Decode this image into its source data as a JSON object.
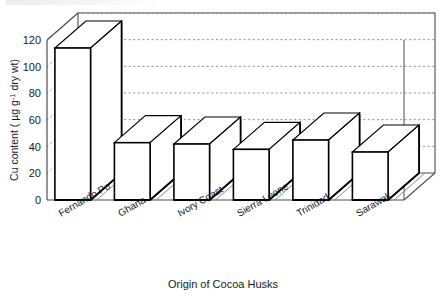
{
  "chart_data": {
    "type": "bar",
    "title": "",
    "subtitle": "",
    "xlabel": "Origin of Cocoa Husks",
    "ylabel": "Cu content ( µg g⁻¹ dry wt)",
    "ylabel_parts": {
      "pre": "Cu content ( µg g",
      "sup": "-1",
      "post": " dry wt)"
    },
    "categories": [
      "Fernando Po",
      "Ghana",
      "Ivory Coast",
      "Sierra Leone",
      "Trinidad",
      "Sarawak"
    ],
    "values": [
      114,
      43,
      42,
      38,
      45,
      36
    ],
    "ylim": [
      0,
      120
    ],
    "yticks": [
      0,
      20,
      40,
      60,
      80,
      100,
      120
    ],
    "ytick_labels": [
      "0",
      "20",
      "40",
      "60",
      "80",
      "100",
      "120"
    ],
    "grid": "horizontal-dotted-backwall",
    "legend": "none",
    "style": "3d-bar-chart",
    "bar_fill": "#ffffff",
    "bar_stroke": "#000000",
    "axis_color": "#4d4d4d",
    "grid_color": "#808080",
    "annotations": []
  },
  "axis": {
    "y_title": "Cu content ( µg g⁻¹ dry wt)",
    "x_title": "Origin of Cocoa Husks"
  }
}
